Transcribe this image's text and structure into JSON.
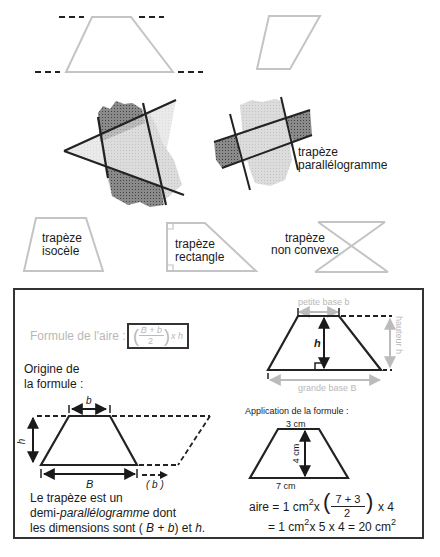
{
  "top_shapes": {
    "trapezoid_dashed": "trapezoid-with-parallel-dashed-lines",
    "parallelogram": "parallelogram-outline"
  },
  "strip_illustrations": {
    "left": "triangle-cut-by-two-parallel-strips",
    "right_label_line1": "trapèze",
    "right_label_line2": "parallélogramme"
  },
  "types": [
    {
      "line1": "trapèze",
      "line2": "isocèle"
    },
    {
      "line1": "trapèze",
      "line2": "rectangle"
    },
    {
      "line1": "trapèze",
      "line2": "non convexe"
    }
  ],
  "formula_panel": {
    "formula_label": "Formule de l'aire :",
    "formula_num": "B + b",
    "formula_den": "2",
    "formula_tail": "x h",
    "origin_line1": "Origine de",
    "origin_line2": "la formule :",
    "diagram_labels": {
      "petite_base": "petite base b",
      "hauteur": "hauteur h",
      "h": "h",
      "grande_base": "grande base B"
    },
    "origin_diagram": {
      "b": "b",
      "h": "h",
      "B": "B",
      "b_paren": "( b )"
    },
    "explanation": {
      "line1": "Le trapèze est un",
      "line2_a": "demi-",
      "line2_b": "parallélogramme",
      "line2_c": " dont",
      "line3_a": "les dimensions sont ( ",
      "line3_b": "B",
      "line3_c": " + ",
      "line3_d": "b",
      "line3_e": ") et ",
      "line3_f": "h",
      "line3_g": "."
    },
    "application": {
      "title": "Application de la formule :",
      "top": "3 cm",
      "height": "4 cm",
      "bottom": "7 cm",
      "calc1_a": "aire = 1 cm",
      "calc1_b": "x",
      "calc1_num": "7 + 3",
      "calc1_den": "2",
      "calc1_tail": "x  4",
      "calc2_a": "= 1 cm",
      "calc2_b": "x  5  x  4  =  20 cm",
      "sq": "2"
    }
  },
  "colors": {
    "ink": "#1a1a1a",
    "grey": "#b8b8b8",
    "light_fill": "#d8d8d8",
    "dark_fill": "#7a7a7a"
  }
}
